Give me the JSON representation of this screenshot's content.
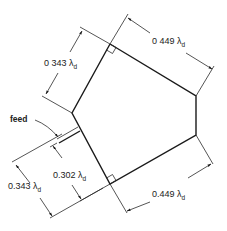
{
  "diagram": {
    "type": "antenna-geometry",
    "labels": {
      "top_left_dim": "0 343 λ",
      "top_right_dim": "0 449 λ",
      "feed_label": "feed",
      "inner_dim": "0.302 λ",
      "bottom_left_dim": "0.343 λ",
      "bottom_right_dim": "0.449 λ",
      "subscript": "d"
    },
    "colors": {
      "line": "#1a1a1a",
      "background": "#ffffff"
    }
  }
}
